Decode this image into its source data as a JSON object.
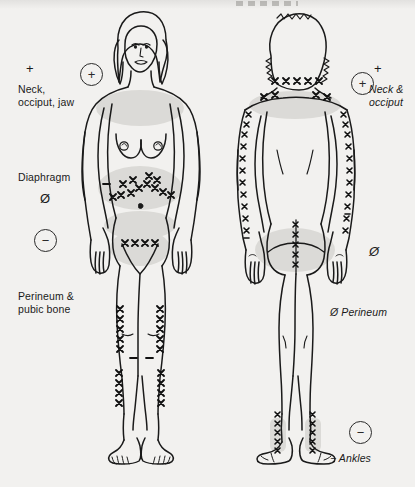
{
  "diagram": {
    "type": "anatomical-body-chart",
    "views": [
      {
        "name": "front-view",
        "figure": "female-anterior"
      },
      {
        "name": "back-view",
        "figure": "female-posterior"
      }
    ],
    "mark_symbol": "x",
    "colors": {
      "background": "#f2f1ef",
      "ink": "#1a1a1a",
      "shading": "#d8d7d3"
    }
  },
  "labels": {
    "front": {
      "neck": {
        "symbol": "+",
        "text": "Neck,\nocciput, jaw",
        "badge": "+"
      },
      "diaphragm": {
        "text": "Diaphragm",
        "symbol": "Ø",
        "body_mark": "-"
      },
      "perineum": {
        "text": "Perineum &\npubic bone",
        "badge": "−"
      }
    },
    "back": {
      "neck": {
        "symbol": "+",
        "text": "Neck &\nocciput",
        "badge": "+"
      },
      "buttock": {
        "symbol": "Ø"
      },
      "perineum": {
        "text": "Ø Perineum"
      },
      "ankles": {
        "text": "− Ankles",
        "badge": "−"
      }
    }
  }
}
